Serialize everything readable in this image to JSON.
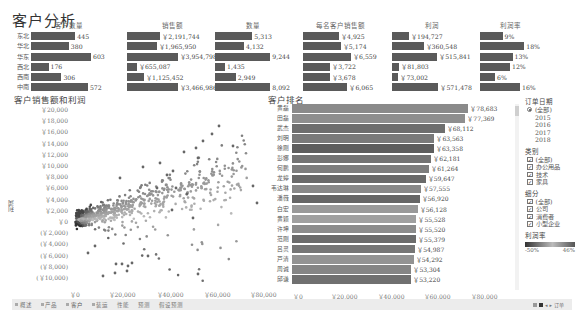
{
  "title": "客户分析",
  "kpis": {
    "regions": [
      "东北",
      "华北",
      "华东",
      "西北",
      "西南",
      "中南"
    ],
    "columns": [
      {
        "header": "客户数量",
        "values": [
          "445",
          "380",
          "603",
          "176",
          "306",
          "572"
        ],
        "raw": [
          445,
          380,
          603,
          176,
          306,
          572
        ]
      },
      {
        "header": "销售额",
        "values": [
          "￥2,191,744",
          "￥1,965,950",
          "￥3,954,798",
          "￥655,087",
          "￥1,125,452",
          "￥3,466,986"
        ],
        "raw": [
          2191744,
          1965950,
          3954798,
          655087,
          1125452,
          3466986
        ]
      },
      {
        "header": "数量",
        "values": [
          "5,313",
          "4,132",
          "9,244",
          "1,435",
          "2,949",
          "8,092"
        ],
        "raw": [
          5313,
          4132,
          9244,
          1435,
          2949,
          8092
        ]
      },
      {
        "header": "每名客户销售额",
        "values": [
          "￥4,925",
          "￥5,174",
          "￥6,559",
          "￥3,722",
          "￥3,678",
          "￥6,065"
        ],
        "raw": [
          4925,
          5174,
          6559,
          3722,
          3678,
          6065
        ]
      },
      {
        "header": "利润",
        "values": [
          "￥194,727",
          "￥360,548",
          "￥515,841",
          "￥81,803",
          "￥73,002",
          "￥571,478"
        ],
        "raw": [
          194727,
          360548,
          515841,
          81803,
          73002,
          571478
        ]
      },
      {
        "header": "利润率",
        "values": [
          "9%",
          "18%",
          "13%",
          "12%",
          "6%",
          "16%"
        ],
        "raw": [
          9,
          18,
          13,
          12,
          6,
          16
        ]
      }
    ]
  },
  "scatter": {
    "title": "客户销售额和利润",
    "y_axis_label": "利润",
    "y_ticks": [
      "￥20,000",
      "￥18,000",
      "￥16,000",
      "￥14,000",
      "￥12,000",
      "￥10,000",
      "￥8,000",
      "￥6,000",
      "￥4,000",
      "￥2,000",
      "￥0",
      "(￥2,000)",
      "(￥4,000)",
      "(￥6,000)",
      "(￥8,000)",
      "(￥10,000)"
    ],
    "x_ticks": [
      "￥0",
      "￥20,000",
      "￥40,000",
      "￥60,000",
      "￥80,000"
    ]
  },
  "ranking": {
    "title": "客户排名",
    "rows": [
      {
        "name": "黄磊",
        "value": "￥78,683",
        "raw": 78683,
        "shade": "#8a8a8a"
      },
      {
        "name": "田磊",
        "value": "￥77,369",
        "raw": 77369,
        "shade": "#8e8e8e"
      },
      {
        "name": "武杰",
        "value": "￥68,112",
        "raw": 68112,
        "shade": "#6e6e6e"
      },
      {
        "name": "刘明",
        "value": "￥63,563",
        "raw": 63563,
        "shade": "#7a7a7a"
      },
      {
        "name": "徐刚",
        "value": "￥63,358",
        "raw": 63358,
        "shade": "#5e5e5e"
      },
      {
        "name": "彭娜",
        "value": "￥62,181",
        "raw": 62181,
        "shade": "#747474"
      },
      {
        "name": "何鹏",
        "value": "￥61,264",
        "raw": 61264,
        "shade": "#7e7e7e"
      },
      {
        "name": "龙婷",
        "value": "￥59,647",
        "raw": 59647,
        "shade": "#6a6a6a"
      },
      {
        "name": "韦达琳",
        "value": "￥57,555",
        "raw": 57555,
        "shade": "#888888"
      },
      {
        "name": "潘薇",
        "value": "￥56,920",
        "raw": 56920,
        "shade": "#666666"
      },
      {
        "name": "白宏",
        "value": "￥56,128",
        "raw": 56128,
        "shade": "#9a9a9a"
      },
      {
        "name": "黄颖",
        "value": "￥55,528",
        "raw": 55528,
        "shade": "#a0a0a0"
      },
      {
        "name": "许坤",
        "value": "￥55,520",
        "raw": 55520,
        "shade": "#8c8c8c"
      },
      {
        "name": "范刚",
        "value": "￥55,379",
        "raw": 55379,
        "shade": "#6c6c6c"
      },
      {
        "name": "吕灵",
        "value": "￥54,987",
        "raw": 54987,
        "shade": "#767676"
      },
      {
        "name": "芦清",
        "value": "￥54,292",
        "raw": 54292,
        "shade": "#939393"
      },
      {
        "name": "周诚",
        "value": "￥53,304",
        "raw": 53304,
        "shade": "#858585"
      },
      {
        "name": "邱谦",
        "value": "￥53,220",
        "raw": 53220,
        "shade": "#707070"
      }
    ],
    "x_ticks": [
      "￥0",
      "￥20,000",
      "￥40,000",
      "￥60,000",
      "￥80,000"
    ],
    "x_max": 100000
  },
  "filters": {
    "order_date": {
      "title": "订单日期",
      "options": [
        {
          "label": "(全部)",
          "selected": true
        },
        {
          "label": "2015",
          "selected": false
        },
        {
          "label": "2016",
          "selected": false
        },
        {
          "label": "2017",
          "selected": false
        },
        {
          "label": "2018",
          "selected": false
        }
      ]
    },
    "category": {
      "title": "类别",
      "options": [
        {
          "label": "(全部)",
          "checked": true
        },
        {
          "label": "办公用品",
          "checked": true
        },
        {
          "label": "技术",
          "checked": true
        },
        {
          "label": "家具",
          "checked": true
        }
      ]
    },
    "segment": {
      "title": "细分",
      "options": [
        {
          "label": "(全部)",
          "checked": true
        },
        {
          "label": "公司",
          "checked": true
        },
        {
          "label": "消费者",
          "checked": true
        },
        {
          "label": "小型企业",
          "checked": true
        }
      ]
    },
    "profit_ratio": {
      "title": "利润率",
      "min": "-50%",
      "max": "46%"
    }
  },
  "tabs": [
    {
      "label": "概述",
      "active": false
    },
    {
      "label": "产品",
      "active": false
    },
    {
      "label": "客户",
      "active": true
    },
    {
      "label": "装运",
      "active": false
    },
    {
      "label": "性能",
      "active": false
    },
    {
      "label": "预测",
      "active": false
    },
    {
      "label": "假设预测",
      "active": false
    }
  ],
  "nav": {
    "check_label": "✓",
    "page_label": "订单"
  }
}
